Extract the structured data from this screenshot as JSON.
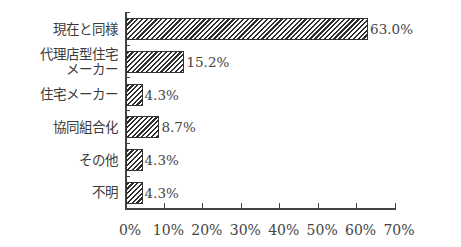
{
  "chart_data": {
    "type": "bar",
    "orientation": "horizontal",
    "title": "",
    "xlabel": "",
    "ylabel": "",
    "categories": [
      "現在と同様",
      "代理店型住宅メーカー",
      "住宅メーカー",
      "協同組合化",
      "その他",
      "不明"
    ],
    "category_lines": [
      [
        "現在と同様"
      ],
      [
        "代理店型住宅",
        "メーカー"
      ],
      [
        "住宅メーカー"
      ],
      [
        "協同組合化"
      ],
      [
        "その他"
      ],
      [
        "不明"
      ]
    ],
    "values": [
      63.0,
      15.2,
      4.3,
      8.7,
      4.3,
      4.3
    ],
    "value_labels": [
      "63.0%",
      "15.2%",
      "4.3%",
      "8.7%",
      "4.3%",
      "4.3%"
    ],
    "xlim": [
      0,
      70
    ],
    "xticks": [
      "0%",
      "10%",
      "20%",
      "30%",
      "40%",
      "50%",
      "60%",
      "70%"
    ],
    "grid": false,
    "legend": null,
    "fill": "diagonal hatch"
  }
}
